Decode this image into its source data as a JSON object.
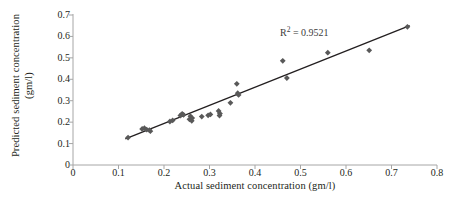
{
  "chart_data": {
    "type": "scatter",
    "title": "",
    "xlabel": "Actual sediment concentration (gm/l)",
    "ylabel_line1": "Predicted sediment concentration",
    "ylabel_line2": "(gm/l)",
    "xlim": [
      0,
      0.8
    ],
    "ylim": [
      0,
      0.7
    ],
    "xticks": [
      0,
      0.1,
      0.2,
      0.3,
      0.4,
      0.5,
      0.6,
      0.7,
      0.8
    ],
    "xtick_labels": [
      "0",
      "0.1",
      "0.2",
      "0.3",
      "0.4",
      "0.5",
      "0.6",
      "0.7",
      "0.8"
    ],
    "yticks": [
      0,
      0.1,
      0.2,
      0.3,
      0.4,
      0.5,
      0.6,
      0.7
    ],
    "ytick_labels": [
      "0",
      "0.1",
      "0.2",
      "0.3",
      "0.4",
      "0.5",
      "0.6",
      "0.7"
    ],
    "grid": false,
    "legend": false,
    "marker_shape": "diamond",
    "marker_color": "#595959",
    "trendline_color": "#231f20",
    "axis_color": "#a6a6a6",
    "series": [
      {
        "name": "Predicted vs actual sediment concentration",
        "points": [
          [
            0.121,
            0.128
          ],
          [
            0.152,
            0.168
          ],
          [
            0.157,
            0.172
          ],
          [
            0.162,
            0.165
          ],
          [
            0.168,
            0.163
          ],
          [
            0.17,
            0.158
          ],
          [
            0.213,
            0.203
          ],
          [
            0.219,
            0.208
          ],
          [
            0.236,
            0.231
          ],
          [
            0.24,
            0.239
          ],
          [
            0.243,
            0.234
          ],
          [
            0.256,
            0.213
          ],
          [
            0.258,
            0.228
          ],
          [
            0.261,
            0.206
          ],
          [
            0.262,
            0.219
          ],
          [
            0.283,
            0.226
          ],
          [
            0.297,
            0.232
          ],
          [
            0.302,
            0.236
          ],
          [
            0.32,
            0.252
          ],
          [
            0.322,
            0.231
          ],
          [
            0.323,
            0.24
          ],
          [
            0.346,
            0.29
          ],
          [
            0.36,
            0.379
          ],
          [
            0.362,
            0.335
          ],
          [
            0.364,
            0.327
          ],
          [
            0.461,
            0.486
          ],
          [
            0.47,
            0.406
          ],
          [
            0.56,
            0.524
          ],
          [
            0.651,
            0.535
          ],
          [
            0.735,
            0.645
          ]
        ]
      }
    ],
    "trendline": {
      "x_start": 0.115,
      "y_start": 0.122,
      "x_end": 0.74,
      "y_end": 0.65
    },
    "annotations": [
      {
        "name": "r-squared",
        "text_prefix": "R",
        "text_sup": "2",
        "text_suffix": " = 0.9521",
        "x": 0.455,
        "y": 0.625
      }
    ]
  }
}
